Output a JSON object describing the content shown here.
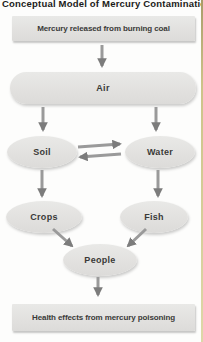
{
  "title": "Conceptual Model of Mercury Contamination",
  "nodes": {
    "source": {
      "label": "Mercury released from burning coal",
      "shape": "rectangle"
    },
    "air": {
      "label": "Air",
      "shape": "ellipse"
    },
    "soil": {
      "label": "Soil",
      "shape": "ellipse"
    },
    "water": {
      "label": "Water",
      "shape": "ellipse"
    },
    "crops": {
      "label": "Crops",
      "shape": "ellipse"
    },
    "fish": {
      "label": "Fish",
      "shape": "ellipse"
    },
    "people": {
      "label": "People",
      "shape": "ellipse"
    },
    "outcome": {
      "label": "Health effects from mercury poisoning",
      "shape": "rectangle"
    }
  },
  "edges": [
    "Mercury released from burning coal → Air",
    "Air → Soil",
    "Air → Water",
    "Soil → Water",
    "Water → Soil",
    "Soil → Crops",
    "Water → Fish",
    "Crops → People",
    "Fish → People",
    "People → Health effects from mercury poisoning"
  ],
  "colors": {
    "node_fill": "#e4e3e1",
    "arrow_stem": "#9a9a9a",
    "arrow_head": "#7c7c7c",
    "node_text": "#3a3a38",
    "title_text": "#1b1b19",
    "background": "#fdfdfc",
    "page_edge": "#cdc389"
  }
}
